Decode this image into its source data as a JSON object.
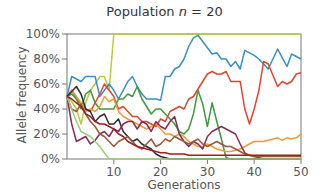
{
  "chart_data": {
    "type": "line",
    "title": "Population n = 20",
    "title_prefix": "Population ",
    "title_var": "n",
    "title_suffix": " = 20",
    "xlabel": "Generations",
    "ylabel": "Allele frequency",
    "xlim": [
      0,
      50
    ],
    "ylim": [
      0,
      100
    ],
    "xticks": [
      10,
      20,
      30,
      40,
      50
    ],
    "yticks": [
      "0%",
      "20%",
      "40%",
      "60%",
      "80%",
      "100%"
    ],
    "grid": false,
    "legend": null,
    "x": [
      0,
      1,
      2,
      3,
      4,
      5,
      6,
      7,
      8,
      9,
      10,
      11,
      12,
      13,
      14,
      15,
      16,
      17,
      18,
      19,
      20,
      21,
      22,
      23,
      24,
      25,
      26,
      27,
      28,
      29,
      30,
      31,
      32,
      33,
      34,
      35,
      36,
      37,
      38,
      39,
      40,
      41,
      42,
      43,
      44,
      45,
      46,
      47,
      48,
      49,
      50
    ],
    "series": [
      {
        "name": "yellow-green",
        "color": "#b5cf3a",
        "values": [
          50,
          46,
          40,
          28,
          45,
          55,
          60,
          66,
          66,
          55,
          100,
          100,
          100,
          100,
          100,
          100,
          100,
          100,
          100,
          100,
          100,
          100,
          100,
          100,
          100,
          100,
          100,
          100,
          100,
          100,
          100,
          100,
          100,
          100,
          100,
          100,
          100,
          100,
          100,
          100,
          100,
          100,
          100,
          100,
          100,
          100,
          100,
          100,
          100,
          100,
          100
        ]
      },
      {
        "name": "blue",
        "color": "#3a8fc4",
        "values": [
          50,
          66,
          64,
          62,
          66,
          66,
          66,
          50,
          55,
          60,
          55,
          48,
          55,
          62,
          66,
          58,
          52,
          48,
          48,
          48,
          47,
          66,
          66,
          72,
          74,
          80,
          90,
          97,
          99,
          94,
          89,
          84,
          85,
          80,
          80,
          74,
          78,
          72,
          87,
          85,
          83,
          80,
          76,
          72,
          80,
          88,
          81,
          74,
          84,
          82,
          80
        ]
      },
      {
        "name": "red",
        "color": "#e0472a",
        "values": [
          50,
          55,
          48,
          44,
          40,
          38,
          45,
          52,
          60,
          55,
          50,
          40,
          42,
          38,
          34,
          34,
          30,
          30,
          28,
          26,
          32,
          30,
          38,
          40,
          42,
          40,
          48,
          50,
          56,
          62,
          68,
          70,
          68,
          68,
          70,
          62,
          62,
          62,
          40,
          28,
          40,
          55,
          78,
          76,
          67,
          58,
          62,
          60,
          62,
          68,
          69
        ]
      },
      {
        "name": "green",
        "color": "#3e9a3e",
        "values": [
          50,
          52,
          48,
          40,
          52,
          55,
          45,
          40,
          40,
          40,
          40,
          48,
          48,
          52,
          50,
          58,
          48,
          42,
          36,
          40,
          40,
          36,
          32,
          28,
          22,
          20,
          24,
          36,
          55,
          44,
          26,
          45,
          30,
          16,
          1,
          0,
          0,
          0,
          0,
          0,
          0,
          0,
          0,
          0,
          0,
          0,
          0,
          0,
          0,
          0,
          0
        ]
      },
      {
        "name": "orange",
        "color": "#f29a3a",
        "values": [
          50,
          55,
          50,
          45,
          38,
          40,
          38,
          42,
          50,
          46,
          48,
          38,
          34,
          32,
          30,
          28,
          26,
          24,
          26,
          28,
          24,
          20,
          20,
          18,
          20,
          18,
          14,
          12,
          10,
          10,
          12,
          10,
          8,
          7,
          6,
          6,
          7,
          8,
          10,
          12,
          14,
          14,
          14,
          15,
          16,
          17,
          15,
          17,
          16,
          17,
          20
        ]
      },
      {
        "name": "dark",
        "color": "#2b2b35",
        "values": [
          50,
          54,
          58,
          52,
          40,
          38,
          30,
          34,
          36,
          28,
          28,
          32,
          22,
          18,
          14,
          16,
          12,
          10,
          8,
          4,
          2,
          1,
          0,
          0,
          0,
          0,
          0,
          0,
          0,
          0,
          0,
          0,
          0,
          0,
          0,
          0,
          0,
          0,
          0,
          0,
          0,
          0,
          0,
          0,
          0,
          0,
          0,
          0,
          0,
          0,
          0
        ]
      },
      {
        "name": "maroon",
        "color": "#8a2a5a",
        "values": [
          50,
          28,
          14,
          16,
          18,
          12,
          15,
          20,
          22,
          18,
          24,
          22,
          28,
          30,
          30,
          24,
          30,
          28,
          22,
          30,
          26,
          24,
          30,
          34,
          20,
          14,
          10,
          14,
          12,
          8,
          18,
          22,
          24,
          26,
          24,
          22,
          20,
          12,
          5,
          3,
          2,
          1,
          0,
          0,
          0,
          0,
          0,
          0,
          0,
          0,
          0
        ]
      },
      {
        "name": "brown",
        "color": "#9a5a3a",
        "values": [
          50,
          40,
          38,
          44,
          36,
          30,
          26,
          20,
          18,
          14,
          10,
          14,
          16,
          18,
          14,
          10,
          8,
          12,
          16,
          10,
          12,
          16,
          14,
          18,
          16,
          14,
          12,
          14,
          16,
          12,
          10,
          12,
          14,
          12,
          10,
          10,
          8,
          6,
          4,
          3,
          2,
          2,
          2,
          2,
          2,
          2,
          2,
          2,
          2,
          2,
          2
        ]
      },
      {
        "name": "light-green",
        "color": "#9bcf7a",
        "values": [
          50,
          40,
          30,
          22,
          20,
          18,
          14,
          10,
          5,
          0,
          0,
          0,
          0,
          0,
          0,
          0,
          0,
          0,
          0,
          0,
          0,
          0,
          0,
          0,
          0,
          0,
          0,
          0,
          0,
          0,
          0,
          0,
          0,
          0,
          0,
          0,
          0,
          0,
          0,
          0,
          0,
          0,
          0,
          0,
          0,
          0,
          0,
          0,
          0,
          0,
          0
        ]
      },
      {
        "name": "dark-red",
        "color": "#a01e1e",
        "values": [
          50,
          48,
          45,
          42,
          36,
          34,
          30,
          28,
          28,
          26,
          24,
          20,
          18,
          14,
          12,
          10,
          9,
          8,
          7,
          6,
          5,
          5,
          4,
          4,
          4,
          4,
          3,
          3,
          3,
          3,
          3,
          3,
          3,
          3,
          3,
          3,
          3,
          3,
          3,
          3,
          3,
          3,
          3,
          3,
          3,
          3,
          3,
          3,
          3,
          3,
          3
        ]
      }
    ]
  }
}
